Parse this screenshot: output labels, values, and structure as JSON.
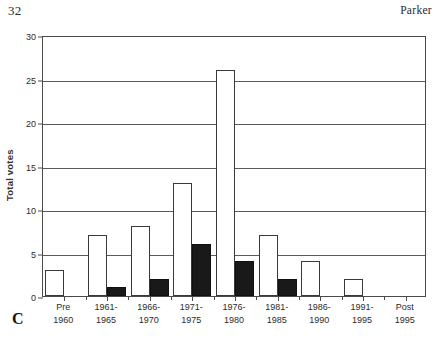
{
  "running_head": {
    "folio": "32",
    "author": "Parker"
  },
  "figure": {
    "panel_letter": "C"
  },
  "chart_data": {
    "type": "bar",
    "title": "",
    "subtitle": "",
    "xlabel": "",
    "ylabel": "Total votes",
    "ylim": [
      0,
      30
    ],
    "ytick_values": [
      0,
      5,
      10,
      15,
      20,
      25,
      30
    ],
    "ytick_labels": [
      "0",
      "5",
      "10",
      "15",
      "20",
      "25",
      "30"
    ],
    "grid": true,
    "legend": "none",
    "categories": [
      "Pre 1960",
      "1961-1965",
      "1966-1970",
      "1971-1975",
      "1976-1980",
      "1981-1985",
      "1986-1990",
      "1991-1995",
      "Post 1995"
    ],
    "category_lines": [
      [
        "Pre",
        "1960"
      ],
      [
        "1961-",
        "1965"
      ],
      [
        "1966-",
        "1970"
      ],
      [
        "1971-",
        "1975"
      ],
      [
        "1976-",
        "1980"
      ],
      [
        "1981-",
        "1985"
      ],
      [
        "1986-",
        "1990"
      ],
      [
        "1991-",
        "1995"
      ],
      [
        "Post",
        "1995"
      ]
    ],
    "series": [
      {
        "name": "white",
        "color": "#ffffff",
        "edge_color": "#3a3a3a",
        "values": [
          3,
          7,
          8,
          13,
          26,
          7,
          4,
          2,
          0
        ]
      },
      {
        "name": "black",
        "color": "#191919",
        "edge_color": "#101010",
        "values": [
          0,
          1,
          2,
          6,
          4,
          2,
          0,
          0,
          0
        ]
      }
    ]
  }
}
